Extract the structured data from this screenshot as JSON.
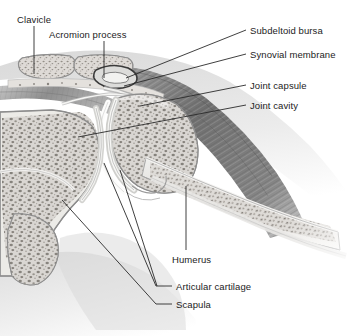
{
  "figure": {
    "kind": "anatomical-illustration",
    "style": "grayscale medical line drawing with stippled trabecular bone",
    "width": 353,
    "height": 336
  },
  "colors": {
    "background": "#ffffff",
    "text": "#1c1c1c",
    "leader_line": "#2a2a2a",
    "bone_outline": "#9a9a9a",
    "trabecular_fill": "#d9d6d2",
    "trabecular_speckle": "#6b6660",
    "cortical_bone": "#ececea",
    "cartilage": "#e6e6e4",
    "muscle_dark": "#6e6e6e",
    "muscle_mid": "#8d8d8d",
    "muscle_light": "#b5b5b5",
    "soft_tissue": "#cfcfcf",
    "joint_cavity": "#fbfbfb"
  },
  "labels": [
    {
      "id": "clavicle",
      "text": "Clavicle",
      "text_x": 17,
      "text_y": 14,
      "anchor": "start",
      "leader": "M 34,26 L 34,74"
    },
    {
      "id": "acromion-process",
      "text": "Acromion process",
      "text_x": 49,
      "text_y": 29,
      "anchor": "start",
      "leader": "M 104,41 L 104,78"
    },
    {
      "id": "subdeltoid-bursa",
      "text": "Subdeltoid bursa",
      "text_x": 250,
      "text_y": 25,
      "anchor": "start",
      "leader": "M 246,30 L 126,78"
    },
    {
      "id": "synovial-membrane",
      "text": "Synovial membrane",
      "text_x": 250,
      "text_y": 49,
      "anchor": "start",
      "leader": "M 246,54 L 124,86"
    },
    {
      "id": "joint-capsule",
      "text": "Joint capsule",
      "text_x": 250,
      "text_y": 80,
      "anchor": "start",
      "leader": "M 246,85 L 140,106"
    },
    {
      "id": "joint-cavity",
      "text": "Joint cavity",
      "text_x": 250,
      "text_y": 100,
      "anchor": "start",
      "leader": "M 246,105 L 78,137"
    },
    {
      "id": "humerus",
      "text": "Humerus",
      "text_x": 172,
      "text_y": 254,
      "anchor": "start",
      "leader": "M 186,250 L 186,186"
    },
    {
      "id": "articular-cartilage",
      "text": "Articular cartilage",
      "text_x": 176,
      "text_y": 281,
      "anchor": "start",
      "leader": "M 172,286 L 156,286 L 104,163"
    },
    {
      "id": "articular-cartilage-second",
      "text": "",
      "text_x": 0,
      "text_y": 0,
      "anchor": "start",
      "leader": "M 157,286 L 120,170"
    },
    {
      "id": "scapula",
      "text": "Scapula",
      "text_x": 176,
      "text_y": 299,
      "anchor": "start",
      "leader": "M 172,304 L 156,304 L 62,200"
    }
  ],
  "structures": [
    {
      "id": "clavicle-bone",
      "name": "Clavicle cross-section"
    },
    {
      "id": "acromion-bone",
      "name": "Acromion process cross-section"
    },
    {
      "id": "subdeltoid-bursa-sac",
      "name": "Subdeltoid bursa"
    },
    {
      "id": "deltoid-muscle",
      "name": "Deltoid muscle"
    },
    {
      "id": "supraspinatus-muscle",
      "name": "Supraspinatus muscle"
    },
    {
      "id": "humeral-head",
      "name": "Head of humerus"
    },
    {
      "id": "humeral-shaft",
      "name": "Shaft of humerus"
    },
    {
      "id": "scapula-bone",
      "name": "Scapula with glenoid fossa"
    },
    {
      "id": "joint-cavity-space",
      "name": "Joint cavity"
    },
    {
      "id": "joint-capsule-band",
      "name": "Joint capsule"
    },
    {
      "id": "articular-cartilage-layer",
      "name": "Articular cartilage"
    }
  ]
}
